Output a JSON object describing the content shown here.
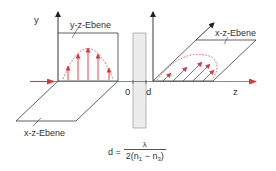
{
  "labels": {
    "y_axis": "y",
    "yz_plane": "y-z-Ebene",
    "xz_plane_right": "x-z-Ebene",
    "xz_plane_left": "x-z-Ebene",
    "origin": "0",
    "thickness": "d",
    "z_axis": "z"
  },
  "formula": {
    "lhs": "d =",
    "numerator": "λ",
    "denominator_prefix": "2(n",
    "sub1": "1",
    "minus": " − n",
    "sub3": "3",
    "denominator_suffix": ")"
  },
  "colors": {
    "accent_red": "#e3323c",
    "line_dark": "#3a3a3a",
    "plate_fill": "#ececec",
    "plate_stroke": "#9a9a9a"
  }
}
